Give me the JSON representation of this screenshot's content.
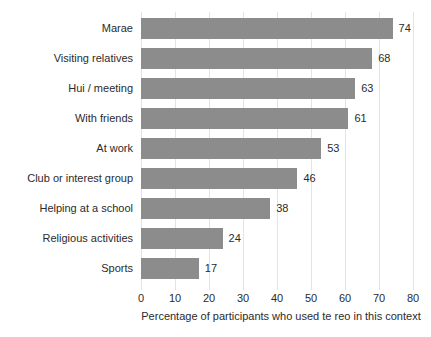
{
  "chart_data": {
    "type": "bar",
    "orientation": "horizontal",
    "title": "",
    "xlabel": "Percentage of participants who used te reo in this context",
    "ylabel": "",
    "xlim": [
      0,
      80
    ],
    "xticks": [
      0,
      10,
      20,
      30,
      40,
      50,
      60,
      70,
      80
    ],
    "grid": true,
    "legend": "none",
    "bar_color": "#8c8c8c",
    "background_color": "#ffffff",
    "categories": [
      "Marae",
      "Visiting relatives",
      "Hui / meeting",
      "With friends",
      "At work",
      "Club or interest group",
      "Helping at a school",
      "Religious activities",
      "Sports"
    ],
    "values": [
      74,
      68,
      63,
      61,
      53,
      46,
      38,
      24,
      17
    ],
    "value_labels": [
      "74",
      "68",
      "63",
      "61",
      "53",
      "46",
      "38",
      "24",
      "17"
    ]
  }
}
